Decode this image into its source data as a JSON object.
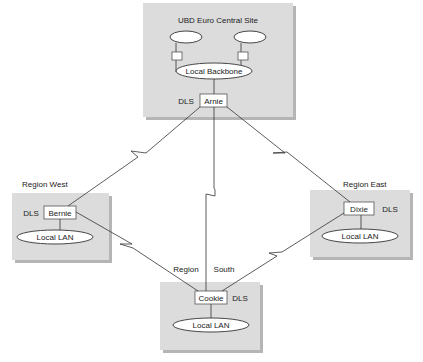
{
  "diagram": {
    "title": "UBD Euro Central Site",
    "sites": {
      "central": {
        "title": "UBD Euro Central Site",
        "backbone_label": "Local Backbone",
        "router_label": "Arnie",
        "dls_label": "DLS"
      },
      "west": {
        "title": "Region West",
        "router_label": "Bernie",
        "dls_label": "DLS",
        "lan_label": "Local LAN"
      },
      "east": {
        "title": "Region East",
        "router_label": "Dixie",
        "dls_label": "DLS",
        "lan_label": "Local LAN"
      },
      "south": {
        "title_part1": "Region",
        "title_part2": "South",
        "router_label": "Cookie",
        "dls_label": "DLS",
        "lan_label": "Local LAN"
      }
    },
    "links": [
      {
        "from": "Arnie",
        "to": "Bernie",
        "type": "WAN"
      },
      {
        "from": "Arnie",
        "to": "Dixie",
        "type": "WAN"
      },
      {
        "from": "Arnie",
        "to": "Cookie",
        "type": "WAN"
      },
      {
        "from": "Bernie",
        "to": "Cookie",
        "type": "WAN"
      },
      {
        "from": "Dixie",
        "to": "Cookie",
        "type": "WAN"
      }
    ],
    "colors": {
      "site_fill": "#dcdcdc",
      "shadow": "#b5b5b5",
      "line": "#333333"
    }
  }
}
